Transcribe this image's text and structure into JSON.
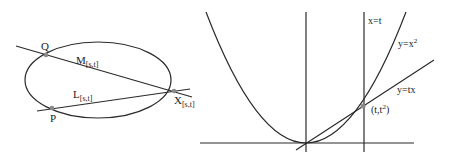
{
  "left_diagram": {
    "title": "ellipse with secant lines",
    "ellipse": {
      "cx": 98,
      "cy": 80,
      "rx": 73,
      "ry": 38
    },
    "points": {
      "Q": {
        "label": "Q",
        "x": 46,
        "y": 55
      },
      "P": {
        "label": "P",
        "x": 52,
        "y": 108
      },
      "X": {
        "label": "X",
        "sub": "[s,t]",
        "x": 174,
        "y": 91
      }
    },
    "lines": {
      "M": {
        "label": "M",
        "sub": "[s,t]"
      },
      "L": {
        "label": "L",
        "sub": "[s,t]"
      }
    }
  },
  "right_diagram": {
    "title": "parabola with line through origin",
    "labels": {
      "vertical_line": "x=t",
      "parabola": "y=x",
      "parabola_exp": "2",
      "line": "y=tx",
      "point": "(t,t",
      "point_exp": "2",
      "point_close": ")"
    }
  },
  "colors": {
    "stroke": "#2a2a2a",
    "point": "#8a8a8a",
    "background": "#ffffff"
  }
}
